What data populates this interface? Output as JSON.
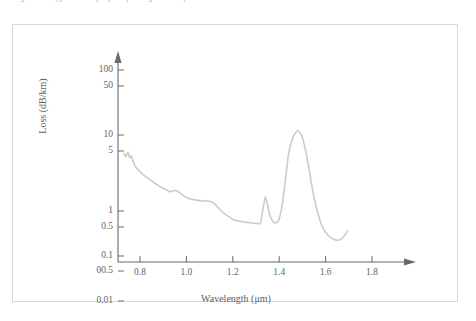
{
  "caption": {
    "text": "Figure 3.6   Typical loss profile of a single-mode fiber"
  },
  "figure": {
    "border_color": "#d8d8d8",
    "background": "#ffffff"
  },
  "chart_data": {
    "type": "line",
    "title": "",
    "xlabel": "Wavelength (μm)",
    "ylabel": "Loss (dB/km)",
    "xlim": [
      0.7,
      1.9
    ],
    "ylim": [
      0.01,
      200
    ],
    "yscale": "log",
    "xscale": "linear",
    "grid": false,
    "legend": null,
    "line_color": "#cbcbcb",
    "axis_color": "#6a6a6a",
    "xticks": [
      "0.8",
      "1.0",
      "1.2",
      "1.4",
      "1.6",
      "1.8"
    ],
    "xtick_values": [
      0.8,
      1.0,
      1.2,
      1.4,
      1.6,
      1.8
    ],
    "yticks": [
      "100",
      "50",
      "10",
      "5",
      "1",
      "0.5",
      "0.1",
      "00.5",
      "0.01"
    ],
    "ytick_values": [
      100,
      50,
      10,
      5,
      1,
      0.5,
      0.1,
      0.05,
      0.01
    ],
    "ytick_pixels": [
      45,
      61,
      110,
      126,
      186,
      202,
      231,
      246,
      276
    ],
    "series": [
      {
        "name": "Fiber attenuation",
        "x": [
          0.73,
          0.74,
          0.748,
          0.755,
          0.762,
          0.77,
          0.78,
          0.795,
          0.81,
          0.83,
          0.85,
          0.87,
          0.89,
          0.91,
          0.93,
          0.945,
          0.955,
          0.965,
          0.98,
          1.0,
          1.02,
          1.04,
          1.06,
          1.08,
          1.1,
          1.12,
          1.14,
          1.16,
          1.18,
          1.2,
          1.215,
          1.23,
          1.24,
          1.25,
          1.262,
          1.275,
          1.29,
          1.305,
          1.32,
          1.34,
          1.36,
          1.375,
          1.388,
          1.398,
          1.41,
          1.425,
          1.44,
          1.46,
          1.48,
          1.5,
          1.52,
          1.545,
          1.57,
          1.59,
          1.61,
          1.63,
          1.655,
          1.675,
          1.695
        ],
        "y": [
          4.7,
          4.3,
          4.85,
          4.2,
          4.4,
          3.8,
          3.3,
          2.95,
          2.7,
          2.45,
          2.25,
          2.05,
          1.9,
          1.78,
          1.68,
          1.72,
          1.74,
          1.68,
          1.56,
          1.44,
          1.38,
          1.34,
          1.32,
          1.31,
          1.3,
          1.22,
          1.08,
          0.92,
          0.8,
          0.7,
          0.66,
          0.64,
          0.63,
          0.62,
          0.61,
          0.6,
          0.59,
          0.585,
          0.6,
          1.45,
          0.82,
          0.62,
          0.6,
          0.68,
          1.05,
          2.1,
          4.6,
          9.2,
          11.6,
          9.0,
          4.2,
          1.7,
          0.8,
          0.46,
          0.32,
          0.26,
          0.24,
          0.28,
          0.4
        ],
        "annotations": [
          {
            "label": "Rayleigh scattering tail",
            "x": 0.8,
            "y": 2.7
          },
          {
            "label": "OH absorption peak",
            "x": 1.24,
            "y": 0.63
          },
          {
            "label": "Water peak",
            "x": 1.39,
            "y": 11.6
          },
          {
            "label": "Loss minimum",
            "x": 1.55,
            "y": 0.24
          }
        ]
      }
    ]
  }
}
